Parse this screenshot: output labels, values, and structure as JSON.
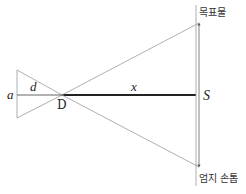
{
  "diagram": {
    "type": "geometry-similar-triangles",
    "labels": {
      "a": "a",
      "d": "d",
      "D": "D",
      "x": "x",
      "S": "S",
      "target": "목표물",
      "thumbnail": "엄지 손톱"
    },
    "colors": {
      "line": "#9a9a9a",
      "thick_line": "#222222",
      "text": "#222222"
    }
  }
}
